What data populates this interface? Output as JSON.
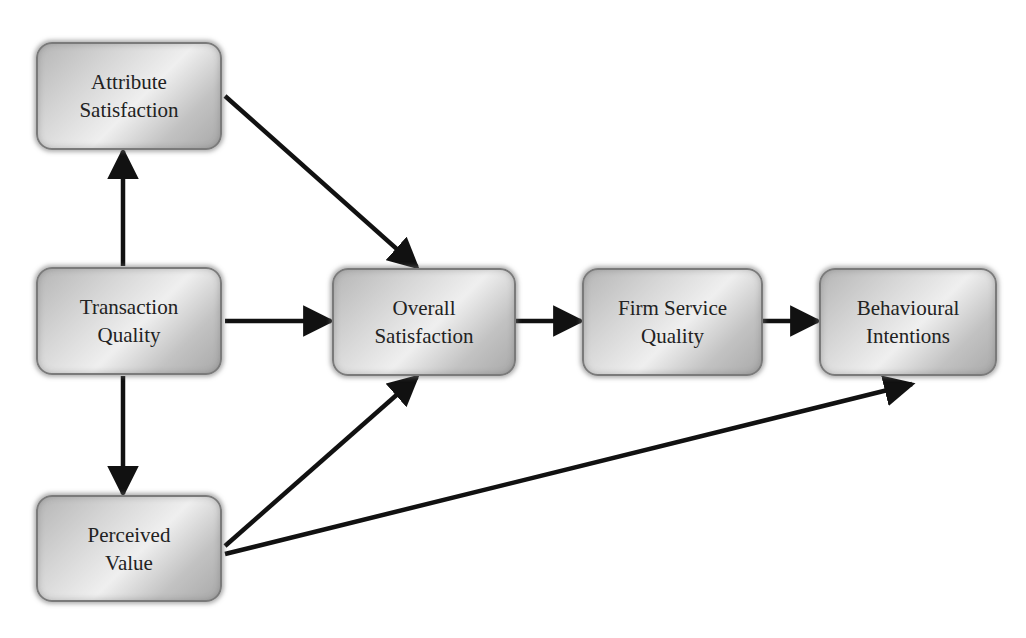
{
  "diagram": {
    "type": "path-model",
    "colors": {
      "background": "#ffffff",
      "node_fill_light": "#efefef",
      "node_fill_dark": "#a9a9a9",
      "node_border": "#7a7a7a",
      "text": "#222222",
      "edge": "#111111"
    },
    "nodes": [
      {
        "id": "attribute_satisfaction",
        "label": "Attribute\nSatisfaction",
        "x": 36,
        "y": 42,
        "w": 186,
        "h": 108
      },
      {
        "id": "transaction_quality",
        "label": "Transaction\nQuality",
        "x": 36,
        "y": 267,
        "w": 186,
        "h": 108
      },
      {
        "id": "perceived_value",
        "label": "Perceived\nValue",
        "x": 36,
        "y": 495,
        "w": 186,
        "h": 107
      },
      {
        "id": "overall_satisfaction",
        "label": "Overall\nSatisfaction",
        "x": 332,
        "y": 268,
        "w": 184,
        "h": 108
      },
      {
        "id": "firm_service_quality",
        "label": "Firm Service\nQuality",
        "x": 582,
        "y": 268,
        "w": 181,
        "h": 108
      },
      {
        "id": "behavioural_intentions",
        "label": "Behavioural\nIntentions",
        "x": 819,
        "y": 268,
        "w": 178,
        "h": 108
      }
    ],
    "edges": [
      {
        "from": "transaction_quality",
        "to": "attribute_satisfaction",
        "x1": 123,
        "y1": 266,
        "x2": 123,
        "y2": 151
      },
      {
        "from": "transaction_quality",
        "to": "perceived_value",
        "x1": 123,
        "y1": 376,
        "x2": 123,
        "y2": 494
      },
      {
        "from": "attribute_satisfaction",
        "to": "overall_satisfaction",
        "x1": 225,
        "y1": 96,
        "x2": 417,
        "y2": 267
      },
      {
        "from": "transaction_quality",
        "to": "overall_satisfaction",
        "x1": 225,
        "y1": 321,
        "x2": 331,
        "y2": 321
      },
      {
        "from": "perceived_value",
        "to": "overall_satisfaction",
        "x1": 225,
        "y1": 546,
        "x2": 417,
        "y2": 377
      },
      {
        "from": "overall_satisfaction",
        "to": "firm_service_quality",
        "x1": 516,
        "y1": 321,
        "x2": 581,
        "y2": 321
      },
      {
        "from": "firm_service_quality",
        "to": "behavioural_intentions",
        "x1": 763,
        "y1": 321,
        "x2": 818,
        "y2": 321
      },
      {
        "from": "perceived_value",
        "to": "behavioural_intentions",
        "x1": 225,
        "y1": 554,
        "x2": 912,
        "y2": 384
      }
    ]
  }
}
